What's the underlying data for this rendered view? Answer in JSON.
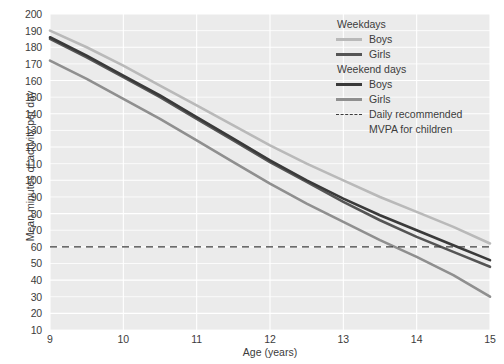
{
  "chart_data": {
    "type": "line",
    "title": "",
    "xlabel": "Age (years)",
    "ylabel": "Mean minutes of activity per day",
    "xlim": [
      9,
      15
    ],
    "ylim": [
      10,
      200
    ],
    "xticks": [
      "9",
      "10",
      "11",
      "12",
      "13",
      "14",
      "15"
    ],
    "yticks": [
      "10",
      "20",
      "30",
      "40",
      "50",
      "60",
      "70",
      "80",
      "90",
      "100",
      "110",
      "120",
      "130",
      "140",
      "150",
      "160",
      "170",
      "180",
      "190",
      "200"
    ],
    "grid": true,
    "legend_position": "top-right",
    "x": [
      9,
      9.5,
      10,
      10.5,
      11,
      11.5,
      12,
      12.5,
      13,
      13.5,
      14,
      14.5,
      15
    ],
    "series": [
      {
        "name": "Weekdays Boys",
        "color": "#b9b9b9",
        "values": [
          190,
          180,
          169,
          157,
          145,
          133,
          121,
          110,
          100,
          90,
          81,
          72,
          62
        ]
      },
      {
        "name": "Weekdays Girls",
        "color": "#555555",
        "values": [
          185,
          174,
          162,
          150,
          137,
          124,
          111,
          99,
          87,
          76,
          66,
          57,
          48
        ]
      },
      {
        "name": "Weekend days Boys",
        "color": "#3a3a3a",
        "values": [
          186,
          175,
          163,
          151,
          138,
          125,
          112,
          100,
          89,
          79,
          70,
          61,
          52
        ]
      },
      {
        "name": "Weekend days Girls",
        "color": "#8f8f8f",
        "values": [
          172,
          161,
          149,
          137,
          124,
          111,
          98,
          86,
          75,
          64,
          54,
          43,
          30
        ]
      }
    ],
    "reference_line": {
      "name": "Daily recommended MVPA for children",
      "value": 60,
      "style": "dashed",
      "color": "#3c3c3c"
    }
  },
  "legend": {
    "group1_title": "Weekdays",
    "group1_items": [
      {
        "label": "Boys",
        "color": "#b9b9b9"
      },
      {
        "label": "Girls",
        "color": "#555555"
      }
    ],
    "group2_title": "Weekend days",
    "group2_items": [
      {
        "label": "Boys",
        "color": "#3a3a3a"
      },
      {
        "label": "Girls",
        "color": "#8f8f8f"
      }
    ],
    "reference_label_line1": "Daily recommended",
    "reference_label_line2": "MVPA for children"
  },
  "colors": {
    "plot_background": "#ebebeb",
    "gridline": "#ffffff",
    "text": "#3c3c3c",
    "page_background": "#ffffff"
  }
}
